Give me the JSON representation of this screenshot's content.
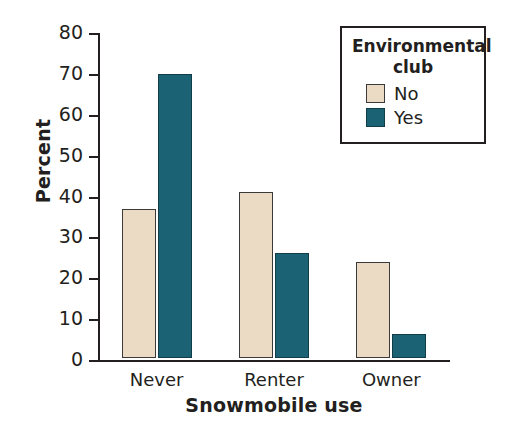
{
  "chart_data": {
    "type": "bar",
    "title": "",
    "xlabel": "Snowmobile use",
    "ylabel": "Percent",
    "ylim": [
      0,
      80
    ],
    "yticks": [
      0,
      10,
      20,
      30,
      40,
      50,
      60,
      70,
      80
    ],
    "grid": false,
    "legend": {
      "title_line1": "Environmental",
      "title_line2": "club",
      "position": "top-right",
      "entries": [
        {
          "label": "No",
          "color": "#ebdbc4"
        },
        {
          "label": "Yes",
          "color": "#1b6374"
        }
      ]
    },
    "categories": [
      "Never",
      "Renter",
      "Owner"
    ],
    "series": [
      {
        "name": "No",
        "color": "#ebdbc4",
        "values": [
          36.5,
          40.7,
          23.4
        ]
      },
      {
        "name": "Yes",
        "color": "#1b6374",
        "values": [
          69.4,
          25.6,
          5.8
        ]
      }
    ]
  },
  "colors": {
    "no": "#ebdbc4",
    "yes": "#1b6374",
    "axis": "#231f20",
    "background": "#ffffff"
  }
}
